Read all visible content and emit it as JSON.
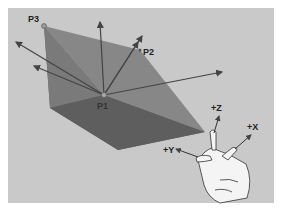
{
  "figure": {
    "points": [
      {
        "id": "P3",
        "label": "P3"
      },
      {
        "id": "P2",
        "label": "P2"
      },
      {
        "id": "P1",
        "label": "P1"
      }
    ],
    "axes": [
      {
        "id": "z",
        "label": "+Z"
      },
      {
        "id": "x",
        "label": "+X"
      },
      {
        "id": "y",
        "label": "+Y"
      }
    ],
    "colors": {
      "background": "#c9c9c9",
      "face_dark": "#6a6a6a",
      "face_mid": "#7e7e7e",
      "face_light": "#8c8c8c",
      "arrow": "#444444"
    }
  }
}
